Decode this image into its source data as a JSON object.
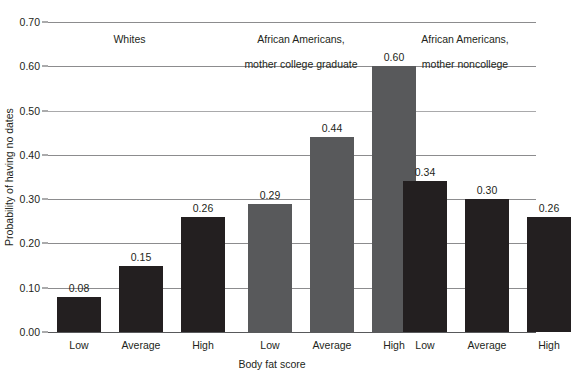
{
  "chart_data": {
    "type": "bar",
    "title": "",
    "xlabel": "Body fat score",
    "ylabel": "Probability of having no dates",
    "ylim": [
      0.0,
      0.7
    ],
    "ytick_labels": [
      "0.00",
      "0.10",
      "0.20",
      "0.30",
      "0.40",
      "0.50",
      "0.60",
      "0.70"
    ],
    "ytick_values": [
      0.0,
      0.1,
      0.2,
      0.3,
      0.4,
      0.5,
      0.6,
      0.7
    ],
    "grid": true,
    "legend": "none",
    "categories": [
      "Low",
      "Average",
      "High"
    ],
    "groups": [
      {
        "name": "Whites",
        "header_lines": "Whites",
        "color": "#231f20",
        "values": [
          0.08,
          0.15,
          0.26
        ],
        "value_labels": [
          "0.08",
          "0.15",
          "0.26"
        ]
      },
      {
        "name": "African Americans, mother college graduate",
        "header_lines": "African Americans,\nmother college graduate",
        "color": "#58595b",
        "values": [
          0.29,
          0.44,
          0.6
        ],
        "value_labels": [
          "0.29",
          "0.44",
          "0.60"
        ]
      },
      {
        "name": "African Americans, mother noncollege",
        "header_lines": "African Americans,\nmother noncollege",
        "color": "#231f20",
        "values": [
          0.34,
          0.3,
          0.26
        ],
        "value_labels": [
          "0.34",
          "0.30",
          "0.26"
        ]
      }
    ]
  },
  "axis": {
    "y_title": "Probability of having no dates",
    "x_title": "Body fat score",
    "ticks": [
      "0.70",
      "0.60",
      "0.50",
      "0.40",
      "0.30",
      "0.20",
      "0.10",
      "0.00"
    ]
  },
  "groups_headers": {
    "g0": "Whites",
    "g1_line1": "African Americans,",
    "g1_line2": "mother college graduate",
    "g2_line1": "African Americans,",
    "g2_line2": "mother noncollege"
  },
  "cat_labels": {
    "g0": [
      "Low",
      "Average",
      "High"
    ],
    "g1": [
      "Low",
      "Average",
      "High"
    ],
    "g2": [
      "Low",
      "Average",
      "High"
    ]
  },
  "values": {
    "g0": [
      "0.08",
      "0.15",
      "0.26"
    ],
    "g1": [
      "0.29",
      "0.44",
      "0.60"
    ],
    "g2": [
      "0.34",
      "0.30",
      "0.26"
    ]
  },
  "colors": {
    "dark": "#231f20",
    "gray": "#58595b",
    "grid": "#8c8c8e",
    "background": "#ffffff"
  }
}
